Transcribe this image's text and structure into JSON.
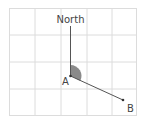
{
  "diagram": {
    "type": "bearing",
    "labels": {
      "north": "North",
      "point_a": "A",
      "point_b": "B"
    },
    "colors": {
      "grid": "#dcdcdc",
      "line": "#555555",
      "angle_fill": "#8a8a8a",
      "text": "#444444"
    },
    "grid": {
      "columns": 5,
      "rows": 4
    }
  }
}
